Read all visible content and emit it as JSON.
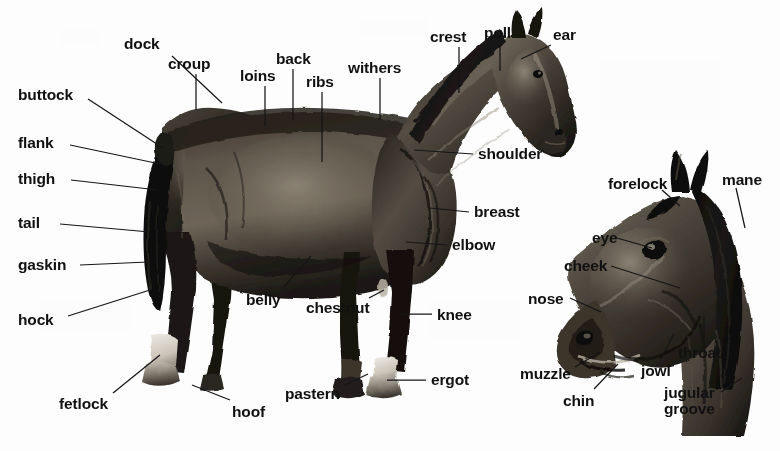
{
  "diagram": {
    "background_color": "#fdfdfd",
    "label_color": "#111111",
    "leader_color": "#161616",
    "coat_tone_dark": "#1d1a17",
    "coat_tone_mid": "#4a443d",
    "coat_tone_light": "#8d857a",
    "views": [
      {
        "id": "body",
        "name": "full-body-side-view"
      },
      {
        "id": "head",
        "name": "head-detail-view"
      }
    ]
  },
  "labels": [
    {
      "id": "dock",
      "text": "dock",
      "view": "body",
      "x": 124,
      "y": 36,
      "leader": [
        [
          172,
          56
        ],
        [
          222,
          103
        ]
      ]
    },
    {
      "id": "croup",
      "text": "croup",
      "view": "body",
      "x": 168,
      "y": 56,
      "leader": [
        [
          196,
          74
        ],
        [
          196,
          110
        ]
      ]
    },
    {
      "id": "loins",
      "text": "loins",
      "view": "body",
      "x": 240,
      "y": 68,
      "leader": [
        [
          265,
          86
        ],
        [
          265,
          126
        ]
      ]
    },
    {
      "id": "back",
      "text": "back",
      "view": "body",
      "x": 276,
      "y": 51,
      "leader": [
        [
          293,
          69
        ],
        [
          293,
          120
        ]
      ]
    },
    {
      "id": "ribs",
      "text": "ribs",
      "view": "body",
      "x": 306,
      "y": 74,
      "leader": [
        [
          322,
          92
        ],
        [
          322,
          162
        ]
      ]
    },
    {
      "id": "withers",
      "text": "withers",
      "view": "body",
      "x": 348,
      "y": 60,
      "leader": [
        [
          380,
          78
        ],
        [
          380,
          120
        ]
      ]
    },
    {
      "id": "crest",
      "text": "crest",
      "view": "body",
      "x": 430,
      "y": 29,
      "leader": [
        [
          459,
          47
        ],
        [
          459,
          93
        ]
      ]
    },
    {
      "id": "poll",
      "text": "poll",
      "view": "body",
      "x": 484,
      "y": 25,
      "leader": [
        [
          500,
          43
        ],
        [
          500,
          71
        ]
      ]
    },
    {
      "id": "ear",
      "text": "ear",
      "view": "body",
      "x": 553,
      "y": 27,
      "leader": [
        [
          551,
          45
        ],
        [
          521,
          59
        ]
      ]
    },
    {
      "id": "buttock",
      "text": "buttock",
      "view": "body",
      "x": 18,
      "y": 87,
      "leader": [
        [
          88,
          99
        ],
        [
          163,
          148
        ]
      ]
    },
    {
      "id": "flank",
      "text": "flank",
      "view": "body",
      "x": 18,
      "y": 135,
      "leader": [
        [
          70,
          145
        ],
        [
          160,
          164
        ]
      ]
    },
    {
      "id": "thigh",
      "text": "thigh",
      "view": "body",
      "x": 18,
      "y": 171,
      "leader": [
        [
          71,
          180
        ],
        [
          158,
          190
        ]
      ]
    },
    {
      "id": "tail",
      "text": "tail",
      "view": "body",
      "x": 18,
      "y": 215,
      "leader": [
        [
          60,
          224
        ],
        [
          150,
          232
        ]
      ]
    },
    {
      "id": "gaskin",
      "text": "gaskin",
      "view": "body",
      "x": 18,
      "y": 257,
      "leader": [
        [
          80,
          265
        ],
        [
          148,
          262
        ]
      ]
    },
    {
      "id": "hock",
      "text": "hock",
      "view": "body",
      "x": 18,
      "y": 312,
      "leader": [
        [
          68,
          316
        ],
        [
          150,
          290
        ]
      ]
    },
    {
      "id": "shoulder",
      "text": "shoulder",
      "view": "body",
      "x": 478,
      "y": 146,
      "leader": [
        [
          473,
          154
        ],
        [
          414,
          150
        ]
      ]
    },
    {
      "id": "breast",
      "text": "breast",
      "view": "body",
      "x": 474,
      "y": 204,
      "leader": [
        [
          469,
          212
        ],
        [
          430,
          208
        ]
      ]
    },
    {
      "id": "elbow",
      "text": "elbow",
      "view": "body",
      "x": 452,
      "y": 237,
      "leader": [
        [
          447,
          245
        ],
        [
          406,
          242
        ]
      ]
    },
    {
      "id": "knee",
      "text": "knee",
      "view": "body",
      "x": 437,
      "y": 307,
      "leader": [
        [
          432,
          314
        ],
        [
          398,
          314
        ]
      ]
    },
    {
      "id": "ergot",
      "text": "ergot",
      "view": "body",
      "x": 431,
      "y": 372,
      "leader": [
        [
          426,
          380
        ],
        [
          387,
          380
        ]
      ]
    },
    {
      "id": "belly",
      "text": "belly",
      "view": "body",
      "x": 246,
      "y": 292,
      "leader": [
        [
          283,
          288
        ],
        [
          311,
          256
        ]
      ]
    },
    {
      "id": "chestnut",
      "text": "chestnut",
      "view": "body",
      "x": 306,
      "y": 300,
      "leader": [
        [
          369,
          298
        ],
        [
          384,
          290
        ]
      ]
    },
    {
      "id": "pastern",
      "text": "pastern",
      "view": "body",
      "x": 285,
      "y": 386,
      "leader": [
        [
          345,
          385
        ],
        [
          368,
          374
        ]
      ]
    },
    {
      "id": "hoof",
      "text": "hoof",
      "view": "body",
      "x": 232,
      "y": 404,
      "leader": [
        [
          230,
          400
        ],
        [
          192,
          385
        ]
      ]
    },
    {
      "id": "fetlock",
      "text": "fetlock",
      "view": "body",
      "x": 59,
      "y": 396,
      "leader": [
        [
          113,
          393
        ],
        [
          160,
          355
        ]
      ]
    },
    {
      "id": "forelock",
      "text": "forelock",
      "view": "head",
      "x": 608,
      "y": 176,
      "leader": [
        [
          662,
          190
        ],
        [
          680,
          206
        ]
      ]
    },
    {
      "id": "mane",
      "text": "mane",
      "view": "head",
      "x": 722,
      "y": 172,
      "leader": [
        [
          736,
          188
        ],
        [
          745,
          228
        ]
      ]
    },
    {
      "id": "eye",
      "text": "eye",
      "view": "head",
      "x": 592,
      "y": 230,
      "leader": [
        [
          617,
          238
        ],
        [
          652,
          248
        ]
      ]
    },
    {
      "id": "cheek",
      "text": "cheek",
      "view": "head",
      "x": 564,
      "y": 258,
      "leader": [
        [
          611,
          266
        ],
        [
          680,
          288
        ]
      ]
    },
    {
      "id": "nose",
      "text": "nose",
      "view": "head",
      "x": 528,
      "y": 291,
      "leader": [
        [
          570,
          298
        ],
        [
          601,
          312
        ]
      ]
    },
    {
      "id": "muzzle",
      "text": "muzzle",
      "view": "head",
      "x": 520,
      "y": 366,
      "leader": [
        [
          575,
          367
        ],
        [
          600,
          352
        ]
      ]
    },
    {
      "id": "chin",
      "text": "chin",
      "view": "head",
      "x": 563,
      "y": 393,
      "leader": [
        [
          594,
          389
        ],
        [
          618,
          364
        ]
      ]
    },
    {
      "id": "jowl",
      "text": "jowl",
      "view": "head",
      "x": 641,
      "y": 363,
      "leader": [
        [
          661,
          359
        ],
        [
          674,
          333
        ]
      ]
    },
    {
      "id": "throat",
      "text": "throat",
      "view": "head",
      "x": 678,
      "y": 345,
      "leader": [
        [
          704,
          341
        ],
        [
          704,
          317
        ]
      ]
    },
    {
      "id": "jugular_groove",
      "text": "jugular\ngroove",
      "view": "head",
      "x": 664,
      "y": 385,
      "leader": [
        [
          721,
          392
        ],
        [
          742,
          378
        ]
      ]
    }
  ]
}
